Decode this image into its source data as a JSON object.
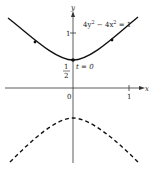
{
  "diagram": {
    "equation": "4y² − 4x² = 1",
    "equation_parts": {
      "a": "4y",
      "sup1": "2",
      "b": " − 4x",
      "sup2": "2",
      "c": " = 1"
    },
    "axes": {
      "x_label": "x",
      "y_label": "y",
      "origin_label": "0",
      "x_tick_label": "1",
      "y_tick_label": "1"
    },
    "vertex": {
      "fraction_num": "1",
      "fraction_den": "2",
      "param_label": "t = 0"
    },
    "curves": [
      {
        "name": "upper-branch",
        "style": "solid",
        "description": "y = sqrt(1/4 + x^2)"
      },
      {
        "name": "lower-branch",
        "style": "dashed",
        "description": "y = -sqrt(1/4 + x^2)"
      }
    ],
    "colors": {
      "curve": "#111111",
      "axis": "#333333",
      "text": "#222222"
    }
  }
}
